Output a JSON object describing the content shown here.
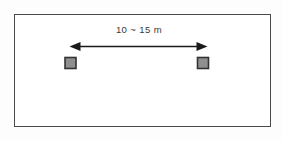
{
  "figure": {
    "type": "technical-diagram",
    "background_color": "#fdfdfd",
    "frame": {
      "border_color": "#4a4a4a",
      "fill_color": "#ffffff"
    },
    "dimension": {
      "label": "10 ~ 15 m",
      "min_value": "10",
      "max_value": "15",
      "separator": "~",
      "unit": "m",
      "text_color": "#3a3a3a",
      "arrow_color": "#1a1a1a",
      "arrow_style": "double-headed"
    },
    "markers": [
      {
        "name": "left-square-marker",
        "fill_color": "#8f8f8f",
        "border_color": "#333333"
      },
      {
        "name": "right-square-marker",
        "fill_color": "#8f8f8f",
        "border_color": "#333333"
      }
    ]
  }
}
